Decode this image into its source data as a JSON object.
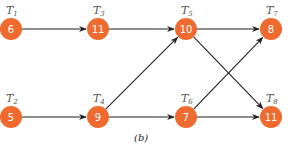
{
  "figure": {
    "caption": "(b)",
    "node_fill": "#ee6a2f",
    "edge_color": "#1f1f1f",
    "nodes": [
      {
        "id": "T1",
        "label_main": "T",
        "label_sub": "1",
        "value": "6",
        "x": 11,
        "y": 29
      },
      {
        "id": "T2",
        "label_main": "T",
        "label_sub": "2",
        "value": "5",
        "x": 11,
        "y": 117
      },
      {
        "id": "T3",
        "label_main": "T",
        "label_sub": "3",
        "value": "11",
        "x": 98,
        "y": 29
      },
      {
        "id": "T4",
        "label_main": "T",
        "label_sub": "4",
        "value": "9",
        "x": 98,
        "y": 117
      },
      {
        "id": "T5",
        "label_main": "T",
        "label_sub": "5",
        "value": "10",
        "x": 186,
        "y": 29
      },
      {
        "id": "T6",
        "label_main": "T",
        "label_sub": "6",
        "value": "7",
        "x": 186,
        "y": 117
      },
      {
        "id": "T7",
        "label_main": "T",
        "label_sub": "7",
        "value": "8",
        "x": 271,
        "y": 29
      },
      {
        "id": "T8",
        "label_main": "T",
        "label_sub": "8",
        "value": "11",
        "x": 271,
        "y": 117
      }
    ],
    "edges": [
      {
        "from": "T1",
        "to": "T3"
      },
      {
        "from": "T3",
        "to": "T5"
      },
      {
        "from": "T5",
        "to": "T7"
      },
      {
        "from": "T5",
        "to": "T8"
      },
      {
        "from": "T2",
        "to": "T4"
      },
      {
        "from": "T4",
        "to": "T5"
      },
      {
        "from": "T4",
        "to": "T6"
      },
      {
        "from": "T6",
        "to": "T7"
      },
      {
        "from": "T6",
        "to": "T8"
      }
    ]
  }
}
